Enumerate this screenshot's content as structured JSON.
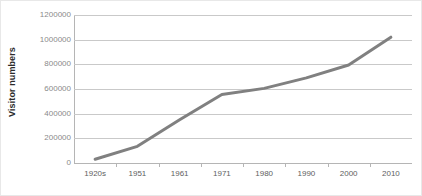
{
  "chart_data": {
    "type": "line",
    "title": "",
    "xlabel": "",
    "ylabel": "Visitor numbers",
    "categories": [
      "1920s",
      "1951",
      "1961",
      "1971",
      "1980",
      "1990",
      "2000",
      "2010"
    ],
    "values": [
      30000,
      135000,
      350000,
      555000,
      605000,
      690000,
      795000,
      1020000
    ],
    "series": [
      {
        "name": "Visitor numbers",
        "values": [
          30000,
          135000,
          350000,
          555000,
          605000,
          690000,
          795000,
          1020000
        ],
        "color": "#808080"
      }
    ],
    "ylim": [
      0,
      1200000
    ],
    "ytick_values": [
      0,
      200000,
      400000,
      600000,
      800000,
      1000000,
      1200000
    ],
    "ytick_labels": [
      "0",
      "200000",
      "400000",
      "600000",
      "800000",
      "1000000",
      "1200000"
    ],
    "grid": true,
    "grid_axis": "y",
    "legend": false,
    "legend_position": "none",
    "markers": false,
    "line_width": 3,
    "colors": {
      "series_line": "#808080",
      "gridline": "#c9c9c9",
      "axis_line": "#b5b5b5",
      "tick_label": "#8a8a8a",
      "x_tick_label": "#5e5e5e",
      "axis_title": "#2b2b2b",
      "plot_background": "#ffffff",
      "image_border": "#e8e8e8"
    }
  }
}
